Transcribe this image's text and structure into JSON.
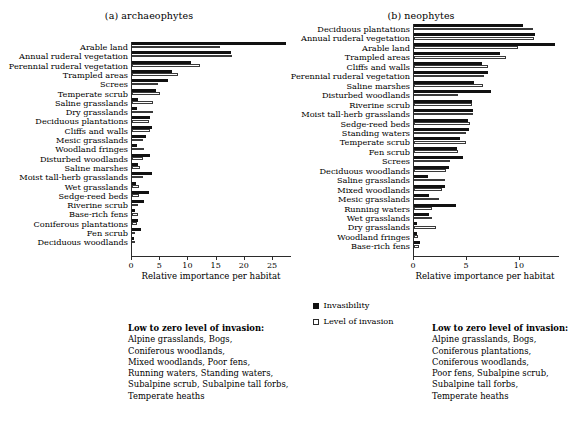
{
  "figure": {
    "axis_title": "Relative importance per habitat"
  },
  "legend": {
    "items": [
      {
        "label": "Invasibility",
        "swatch": "filled-square",
        "color": "#111111"
      },
      {
        "label": "Level of invasion",
        "swatch": "open-square",
        "color": "#ffffff"
      }
    ]
  },
  "notes": {
    "left": {
      "heading": "Low to zero level of invasion:",
      "lines": [
        "Alpine grasslands, Bogs,",
        "Coniferous woodlands,",
        "Mixed woodlands, Poor fens,",
        "Running waters, Standing waters,",
        "Subalpine scrub, Subalpine tall forbs,",
        "Temperate heaths"
      ]
    },
    "right": {
      "heading": "Low to zero level of invasion:",
      "lines": [
        "Alpine grasslands, Bogs,",
        "Coniferous plantations,",
        "Coniferous woodlands,",
        "Poor fens, Subalpine scrub,",
        "Subalpine tall forbs,",
        "Temperate heaths"
      ]
    }
  },
  "chart_data": [
    {
      "id": "archaeophytes",
      "type": "bar",
      "orientation": "horizontal",
      "title": "(a) archaeophytes",
      "xlabel": "Relative importance per habitat",
      "ylabel": "",
      "xlim": [
        0,
        28
      ],
      "xticks": [
        0,
        5,
        10,
        15,
        20,
        25
      ],
      "grid": false,
      "legend_position": "center",
      "categories": [
        "Arable land",
        "Annual ruderal vegetation",
        "Perennial ruderal vegetation",
        "Trampled areas",
        "Screes",
        "Temperate scrub",
        "Saline grasslands",
        "Dry grasslands",
        "Deciduous plantations",
        "Cliffs and walls",
        "Mesic grasslands",
        "Woodland fringes",
        "Disturbed woodlands",
        "Saline marshes",
        "Moist tall-herb grasslands",
        "Wet grasslands",
        "Sedge-reed beds",
        "Riverine scrub",
        "Base-rich fens",
        "Coniferous plantations",
        "Fen scrub",
        "Deciduous woodlands"
      ],
      "series": [
        {
          "name": "Invasibility",
          "values": [
            27.3,
            17.5,
            10.5,
            7.1,
            6.3,
            4.3,
            1.1,
            0.8,
            3.2,
            3.5,
            2.5,
            0.9,
            3.2,
            1.1,
            3.6,
            0.7,
            3.0,
            2.2,
            0.6,
            1.1,
            1.6,
            0.3
          ]
        },
        {
          "name": "Level of invasion",
          "values": [
            15.6,
            17.8,
            12.1,
            8.1,
            4.6,
            4.9,
            3.8,
            3.7,
            3.1,
            3.2,
            1.9,
            2.2,
            2.0,
            1.5,
            1.9,
            1.2,
            1.2,
            1.1,
            1.1,
            0.8,
            0.6,
            0.5
          ]
        }
      ]
    },
    {
      "id": "neophytes",
      "type": "bar",
      "orientation": "horizontal",
      "title": "(b) neophytes",
      "xlabel": "Relative importance per habitat",
      "ylabel": "",
      "xlim": [
        0,
        13.5
      ],
      "xticks": [
        0,
        5,
        10
      ],
      "grid": false,
      "legend_position": "center",
      "categories": [
        "Deciduous plantations",
        "Annual ruderal vegetation",
        "Arable land",
        "Trampled areas",
        "Cliffs and walls",
        "Perennial ruderal vegetation",
        "Saline marshes",
        "Disturbed woodlands",
        "Riverine scrub",
        "Moist tall-herb grasslands",
        "Sedge-reed beds",
        "Standing waters",
        "Temperate scrub",
        "Fen scrub",
        "Screes",
        "Deciduous woodlands",
        "Saline grasslands",
        "Mixed woodlands",
        "Mesic grasslands",
        "Running waters",
        "Wet grasslands",
        "Dry grasslands",
        "Woodland fringes",
        "Base-rich fens"
      ],
      "series": [
        {
          "name": "Invasibility",
          "values": [
            10.3,
            11.4,
            13.3,
            8.1,
            6.4,
            7.0,
            5.7,
            7.3,
            5.5,
            5.6,
            5.1,
            5.2,
            4.3,
            4.1,
            4.6,
            3.3,
            1.3,
            2.9,
            1.4,
            4.0,
            1.4,
            0.3,
            0.3,
            0.6
          ]
        },
        {
          "name": "Level of invasion",
          "values": [
            11.2,
            11.3,
            9.8,
            8.7,
            7.0,
            6.6,
            6.5,
            4.2,
            5.5,
            5.6,
            5.3,
            4.9,
            4.9,
            4.2,
            3.4,
            3.0,
            2.9,
            2.6,
            2.4,
            1.7,
            1.7,
            2.1,
            0.4,
            0.5
          ]
        }
      ]
    }
  ]
}
